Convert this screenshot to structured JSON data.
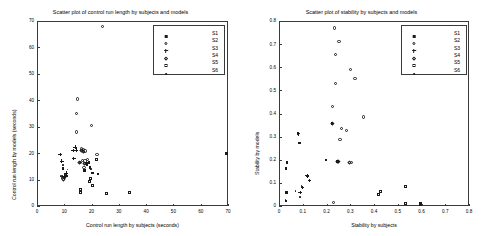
{
  "chart_data": [
    {
      "type": "scatter",
      "id": "control-run-length",
      "title": "Scatter plot of control run length by subjects and models",
      "xlabel": "Control run length by subjects (seconds)",
      "ylabel": "Control run length by models (seconds)",
      "xlim": [
        0,
        70
      ],
      "ylim": [
        0,
        70
      ],
      "xticks": [
        0,
        10,
        20,
        30,
        40,
        50,
        60,
        70
      ],
      "yticks": [
        0,
        10,
        20,
        30,
        40,
        50,
        60,
        70
      ],
      "grid": false,
      "legend_position": "top-right",
      "legend": [
        "S1",
        "S2",
        "S3",
        "S4",
        "S5",
        "S6"
      ],
      "series": [
        {
          "name": "S1",
          "marker": "filled-square",
          "points": [
            [
              17.5,
              13.3
            ],
            [
              18.4,
              15.6
            ],
            [
              18.6,
              16.2
            ],
            [
              19.2,
              16.4
            ],
            [
              19.6,
              14.5
            ],
            [
              20.4,
              12.3
            ],
            [
              22.5,
              12.0
            ],
            [
              69.5,
              19.8
            ],
            [
              11.0,
              11.2
            ],
            [
              9.6,
              14.0
            ]
          ]
        },
        {
          "name": "S2",
          "marker": "circle",
          "points": [
            [
              24.0,
              68.0
            ],
            [
              14.9,
              40.5
            ],
            [
              14.6,
              35.0
            ],
            [
              14.4,
              28.0
            ],
            [
              16.4,
              21.6
            ],
            [
              17.0,
              21.4
            ],
            [
              17.6,
              20.8
            ],
            [
              20.1,
              30.4
            ],
            [
              16.8,
              17.2
            ],
            [
              17.6,
              17.0
            ],
            [
              18.6,
              17.6
            ],
            [
              22.0,
              19.5
            ],
            [
              17.2,
              14.7
            ],
            [
              15.9,
              16.5
            ]
          ]
        },
        {
          "name": "S3",
          "marker": "plus",
          "points": [
            [
              8.4,
              19.6
            ],
            [
              9.0,
              17.0
            ],
            [
              13.9,
              22.3
            ],
            [
              13.2,
              21.0
            ],
            [
              13.4,
              18.0
            ],
            [
              14.2,
              21.2
            ],
            [
              10.6,
              12.5
            ],
            [
              9.8,
              11.4
            ]
          ]
        },
        {
          "name": "S4",
          "marker": "diamond",
          "points": [
            [
              16.2,
              21.0
            ],
            [
              16.9,
              20.4
            ],
            [
              17.4,
              16.2
            ],
            [
              18.2,
              16.0
            ],
            [
              15.6,
              16.4
            ],
            [
              10.2,
              10.6
            ],
            [
              9.8,
              10.1
            ]
          ]
        },
        {
          "name": "S5",
          "marker": "square",
          "points": [
            [
              19.2,
              9.3
            ],
            [
              16.0,
              6.2
            ],
            [
              16.0,
              5.0
            ],
            [
              20.4,
              7.8
            ],
            [
              22.0,
              17.6
            ],
            [
              25.4,
              4.6
            ],
            [
              33.8,
              5.0
            ],
            [
              19.8,
              10.2
            ]
          ]
        },
        {
          "name": "S6",
          "marker": "dot",
          "points": [
            [
              9.8,
              15.2
            ],
            [
              11.4,
              13.5
            ],
            [
              9.4,
              11.0
            ],
            [
              9.8,
              10.6
            ],
            [
              10.4,
              10.2
            ],
            [
              9.2,
              10.4
            ],
            [
              8.9,
              11.0
            ],
            [
              10.8,
              11.6
            ],
            [
              20.0,
              13.6
            ]
          ]
        }
      ]
    },
    {
      "type": "scatter",
      "id": "stability",
      "title": "Scatter plot of stability by subjects and models",
      "xlabel": "Stability by subjects",
      "ylabel": "Stability by models",
      "xlim": [
        0,
        0.8
      ],
      "ylim": [
        0,
        0.8
      ],
      "xticks": [
        0,
        0.1,
        0.2,
        0.3,
        0.4,
        0.5,
        0.6,
        0.7,
        0.8
      ],
      "yticks": [
        0,
        0.1,
        0.2,
        0.3,
        0.4,
        0.5,
        0.6,
        0.7,
        0.8
      ],
      "grid": false,
      "legend_position": "top-right",
      "legend": [
        "S1",
        "S2",
        "S3",
        "S4",
        "S5",
        "S6"
      ],
      "series": [
        {
          "name": "S1",
          "marker": "filled-square",
          "points": [
            [
              0.225,
              0.355
            ],
            [
              0.2,
              0.198
            ],
            [
              0.246,
              0.192
            ],
            [
              0.25,
              0.19
            ],
            [
              0.035,
              0.188
            ],
            [
              0.03,
              0.16
            ],
            [
              0.082,
              0.313
            ],
            [
              0.088,
              0.272
            ],
            [
              0.033,
              0.056
            ],
            [
              0.03,
              0.02
            ]
          ]
        },
        {
          "name": "S2",
          "marker": "circle",
          "points": [
            [
              0.232,
              0.77
            ],
            [
              0.253,
              0.71
            ],
            [
              0.238,
              0.655
            ],
            [
              0.3,
              0.59
            ],
            [
              0.32,
              0.553
            ],
            [
              0.237,
              0.53
            ],
            [
              0.225,
              0.432
            ],
            [
              0.355,
              0.385
            ],
            [
              0.262,
              0.335
            ],
            [
              0.283,
              0.325
            ],
            [
              0.257,
              0.288
            ],
            [
              0.305,
              0.188
            ],
            [
              0.23,
              0.015
            ]
          ]
        },
        {
          "name": "S3",
          "marker": "plus",
          "points": [
            [
              0.12,
              0.13
            ],
            [
              0.128,
              0.112
            ],
            [
              0.098,
              0.08
            ],
            [
              0.088,
              0.06
            ],
            [
              0.082,
              0.313
            ],
            [
              0.118,
              0.132
            ]
          ]
        },
        {
          "name": "S4",
          "marker": "diamond",
          "points": [
            [
              0.248,
              0.192
            ],
            [
              0.252,
              0.19
            ],
            [
              0.225,
              0.357
            ],
            [
              0.298,
              0.188
            ]
          ]
        },
        {
          "name": "S5",
          "marker": "square",
          "points": [
            [
              0.428,
              0.062
            ],
            [
              0.418,
              0.05
            ],
            [
              0.532,
              0.082
            ],
            [
              0.533,
              0.012
            ],
            [
              0.598,
              0.008
            ],
            [
              0.598,
              0.012
            ]
          ]
        },
        {
          "name": "S6",
          "marker": "dot",
          "points": [
            [
              0.035,
              0.188
            ],
            [
              0.03,
              0.16
            ],
            [
              0.088,
              0.272
            ],
            [
              0.072,
              0.062
            ],
            [
              0.098,
              0.082
            ],
            [
              0.033,
              0.056
            ],
            [
              0.03,
              0.022
            ],
            [
              0.092,
              0.035
            ]
          ]
        }
      ]
    }
  ]
}
